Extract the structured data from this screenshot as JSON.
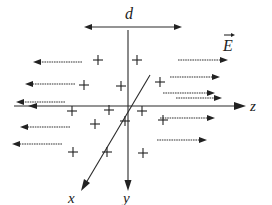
{
  "diagram": {
    "title": "",
    "labels": {
      "separation": "d",
      "field": "E",
      "x_axis": "x",
      "y_axis": "y",
      "z_axis": "z"
    },
    "colors": {
      "ink": "#222222",
      "background": "#ffffff"
    },
    "separation_arrow": {
      "x1": 84,
      "x2": 182,
      "y": 27
    },
    "axes": {
      "y": {
        "x": 128,
        "y1": 30,
        "y2": 190
      },
      "z": {
        "y": 106,
        "x1": 10,
        "x2": 245
      },
      "x": {
        "x1": 150,
        "y1": 75,
        "x2": 82,
        "y2": 190
      }
    },
    "field_arrows_left": [
      {
        "y": 62,
        "from": 82,
        "to": 33
      },
      {
        "y": 84,
        "from": 75,
        "to": 25
      },
      {
        "y": 102,
        "from": 65,
        "to": 16
      },
      {
        "y": 127,
        "from": 70,
        "to": 20
      },
      {
        "y": 144,
        "from": 62,
        "to": 12
      }
    ],
    "field_arrows_right": [
      {
        "y": 60,
        "from": 178,
        "to": 228
      },
      {
        "y": 77,
        "from": 170,
        "to": 220
      },
      {
        "y": 93,
        "from": 163,
        "to": 215
      },
      {
        "y": 98,
        "from": 176,
        "to": 222
      },
      {
        "y": 118,
        "from": 160,
        "to": 215
      },
      {
        "y": 140,
        "from": 157,
        "to": 207
      }
    ],
    "charges": [
      {
        "sign": "+",
        "x": 98,
        "y": 60
      },
      {
        "sign": "+",
        "x": 137,
        "y": 60
      },
      {
        "sign": "+",
        "x": 84,
        "y": 85
      },
      {
        "sign": "+",
        "x": 121,
        "y": 86
      },
      {
        "sign": "+",
        "x": 160,
        "y": 82
      },
      {
        "sign": "+",
        "x": 72,
        "y": 111
      },
      {
        "sign": "+",
        "x": 109,
        "y": 110
      },
      {
        "sign": "+",
        "x": 142,
        "y": 111
      },
      {
        "sign": "+",
        "x": 95,
        "y": 124
      },
      {
        "sign": "+",
        "x": 125,
        "y": 121
      },
      {
        "sign": "+",
        "x": 163,
        "y": 120
      },
      {
        "sign": "+",
        "x": 73,
        "y": 152
      },
      {
        "sign": "+",
        "x": 107,
        "y": 152
      },
      {
        "sign": "+",
        "x": 143,
        "y": 153
      }
    ]
  }
}
